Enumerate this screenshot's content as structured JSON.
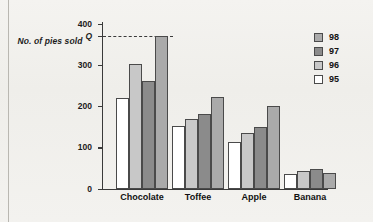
{
  "y_axis_title": "No. of pies sold",
  "chart_data": {
    "type": "bar",
    "title": "",
    "xlabel": "",
    "ylabel": "No. of pies sold",
    "categories": [
      "Chocolate",
      "Toffee",
      "Apple",
      "Banana"
    ],
    "series": [
      {
        "name": "95",
        "color": "#ffffff",
        "values": [
          220,
          152,
          114,
          36
        ]
      },
      {
        "name": "96",
        "color": "#c8c8c8",
        "values": [
          303,
          168,
          134,
          43
        ]
      },
      {
        "name": "97",
        "color": "#8b8b8b",
        "values": [
          260,
          180,
          150,
          48
        ]
      },
      {
        "name": "98",
        "color": "#aaaaaa",
        "values": [
          370,
          222,
          200,
          39
        ]
      }
    ],
    "ylim": [
      0,
      400
    ],
    "yticks": [
      0,
      100,
      200,
      300,
      400
    ],
    "ytick_labels": [
      "0",
      "100",
      "200",
      "300",
      "400"
    ],
    "grid": false,
    "legend_position": "right",
    "legend_entries": [
      "98",
      "97",
      "96",
      "95"
    ],
    "annotations": [
      {
        "label": "Q",
        "value": 370,
        "type": "dashed-horizontal-line",
        "extends_to_category": "Chocolate"
      }
    ]
  }
}
